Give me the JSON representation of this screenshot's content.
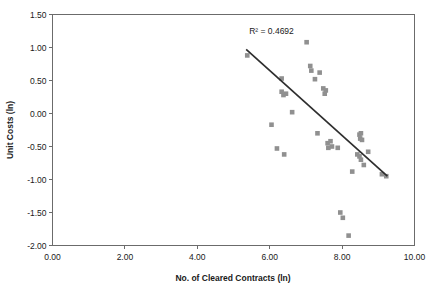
{
  "chart_data": {
    "type": "scatter",
    "title": "",
    "xlabel": "No. of Cleared Contracts (ln)",
    "ylabel": "Unit Costs (ln)",
    "xlim": [
      0.0,
      10.0
    ],
    "ylim": [
      -2.0,
      1.5
    ],
    "xticks": [
      "0.00",
      "2.00",
      "4.00",
      "6.00",
      "8.00",
      "10.00"
    ],
    "xtick_values": [
      0.0,
      2.0,
      4.0,
      6.0,
      8.0,
      10.0
    ],
    "yticks": [
      "1.50",
      "1.00",
      "0.50",
      "0.00",
      "-0.50",
      "-1.00",
      "-1.50",
      "-2.00"
    ],
    "ytick_values": [
      1.5,
      1.0,
      0.5,
      0.0,
      -0.5,
      -1.0,
      -1.5,
      -2.0
    ],
    "grid": false,
    "legend": "none",
    "marker_color": "#909090",
    "marker_shape": "square",
    "trendline_color": "#2e2e2e",
    "annotations": [
      {
        "text": "R² = 0.4692",
        "x": 6.05,
        "y": 1.2
      }
    ],
    "trendline": {
      "x": [
        5.35,
        9.25
      ],
      "y": [
        0.97,
        -0.95
      ]
    },
    "series": [
      {
        "name": "Observations",
        "points": [
          [
            5.38,
            0.88
          ],
          [
            6.33,
            0.53
          ],
          [
            6.33,
            0.33
          ],
          [
            6.38,
            0.28
          ],
          [
            6.45,
            0.3
          ],
          [
            6.62,
            0.02
          ],
          [
            6.05,
            -0.17
          ],
          [
            6.2,
            -0.53
          ],
          [
            6.4,
            -0.62
          ],
          [
            7.02,
            1.08
          ],
          [
            7.12,
            0.72
          ],
          [
            7.15,
            0.65
          ],
          [
            7.25,
            0.52
          ],
          [
            7.38,
            0.62
          ],
          [
            7.48,
            0.38
          ],
          [
            7.55,
            0.35
          ],
          [
            7.52,
            0.3
          ],
          [
            7.32,
            -0.3
          ],
          [
            7.6,
            -0.45
          ],
          [
            7.68,
            -0.42
          ],
          [
            7.72,
            -0.5
          ],
          [
            7.62,
            -0.52
          ],
          [
            7.88,
            -0.52
          ],
          [
            8.48,
            -0.32
          ],
          [
            8.52,
            -0.3
          ],
          [
            8.5,
            -0.38
          ],
          [
            8.55,
            -0.4
          ],
          [
            8.42,
            -0.62
          ],
          [
            8.48,
            -0.65
          ],
          [
            8.52,
            -0.7
          ],
          [
            8.72,
            -0.58
          ],
          [
            8.6,
            -0.78
          ],
          [
            8.28,
            -0.88
          ],
          [
            9.1,
            -0.92
          ],
          [
            9.22,
            -0.95
          ],
          [
            7.95,
            -1.5
          ],
          [
            8.02,
            -1.58
          ],
          [
            8.18,
            -1.85
          ]
        ]
      }
    ]
  }
}
